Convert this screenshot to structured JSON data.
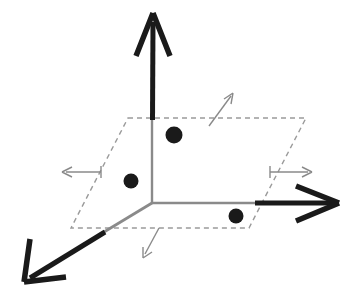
{
  "figure": {
    "type": "diagram",
    "width": 351,
    "height": 302,
    "background_color": "#ffffff"
  },
  "colors": {
    "axis_black": "#1a1a1a",
    "axis_gray": "#8a8a8a",
    "plane_outline_gray": "#9a9a9a",
    "normal_arrow_gray": "#8a8a8a",
    "point_fill": "#1a1a1a",
    "background": "#ffffff"
  },
  "origin": {
    "x": 152,
    "y": 203
  },
  "axes": [
    {
      "name": "z-axis",
      "label": "",
      "direction": "up",
      "style": "solid-thick-black",
      "from": {
        "x": 152,
        "y": 203
      },
      "to": {
        "x": 153,
        "y": 14
      },
      "arrowhead": true,
      "stroke_width": 5
    },
    {
      "name": "x-axis",
      "label": "",
      "direction": "right",
      "style": "solid-thick-black",
      "from": {
        "x": 152,
        "y": 203
      },
      "to": {
        "x": 338,
        "y": 203
      },
      "arrowhead": true,
      "stroke_width": 5
    },
    {
      "name": "y-axis",
      "label": "",
      "direction": "down-left",
      "style": "solid-thick-black",
      "from": {
        "x": 152,
        "y": 203
      },
      "to": {
        "x": 24,
        "y": 281
      },
      "arrowhead": true,
      "stroke_width": 5
    }
  ],
  "axis_segments_inside_plane": [
    {
      "name": "z-axis-inside-plane",
      "from": {
        "x": 152,
        "y": 203
      },
      "to": {
        "x": 152,
        "y": 118
      },
      "style": "solid-thin-gray"
    },
    {
      "name": "x-axis-inside-plane",
      "from": {
        "x": 152,
        "y": 203
      },
      "to": {
        "x": 258,
        "y": 203
      },
      "style": "solid-thin-gray"
    },
    {
      "name": "y-axis-inside-plane",
      "from": {
        "x": 152,
        "y": 203
      },
      "to": {
        "x": 104,
        "y": 232
      },
      "style": "solid-thin-gray"
    }
  ],
  "plane": {
    "name": "dashed-parallelogram",
    "style": "dashed-gray",
    "dash_pattern": "5 4",
    "stroke_width": 1.4,
    "vertices": [
      {
        "label": "top-left",
        "x": 128,
        "y": 118
      },
      {
        "label": "top-right",
        "x": 306,
        "y": 118
      },
      {
        "label": "bottom-right",
        "x": 249,
        "y": 228
      },
      {
        "label": "bottom-left",
        "x": 71,
        "y": 228
      }
    ]
  },
  "points": [
    {
      "name": "point-upper",
      "x": 174,
      "y": 135,
      "radius": 8.5,
      "label": ""
    },
    {
      "name": "point-left",
      "x": 131,
      "y": 181,
      "radius": 7.5,
      "label": ""
    },
    {
      "name": "point-lower-right",
      "x": 236,
      "y": 216,
      "radius": 7.5,
      "label": ""
    }
  ],
  "normal_arrows": [
    {
      "name": "normal-arrow-up-right",
      "from": {
        "x": 209,
        "y": 126
      },
      "to": {
        "x": 233,
        "y": 94
      },
      "style": "thin-gray",
      "stroke_width": 1.4
    },
    {
      "name": "normal-arrow-right",
      "from": {
        "x": 270,
        "y": 172
      },
      "to": {
        "x": 311,
        "y": 172
      },
      "style": "thin-gray",
      "stroke_width": 1.4
    },
    {
      "name": "normal-arrow-left",
      "from": {
        "x": 101,
        "y": 172
      },
      "to": {
        "x": 63,
        "y": 172
      },
      "style": "thin-gray",
      "stroke_width": 1.4
    },
    {
      "name": "normal-arrow-down-left",
      "from": {
        "x": 159,
        "y": 228
      },
      "to": {
        "x": 144,
        "y": 257
      },
      "style": "thin-gray",
      "stroke_width": 1.4
    }
  ]
}
